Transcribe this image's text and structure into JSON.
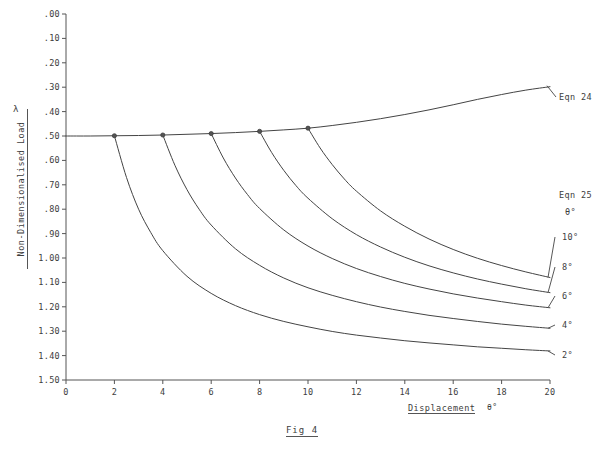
{
  "figure": {
    "caption": "Fig 4",
    "lambda_symbol": "λ"
  },
  "axes": {
    "y_title": "Non-Dimensionalised Load",
    "x_title": "Displacement",
    "x_unit": "θ°",
    "y_ticks": [
      "1.50",
      "1.40",
      "1.30",
      "1.20",
      "1.10",
      "1.00",
      ".90",
      ".80",
      ".70",
      ".60",
      ".50",
      ".40",
      ".30",
      ".20",
      ".10",
      ".00"
    ],
    "x_ticks": [
      "0",
      "2",
      "4",
      "6",
      "8",
      "10",
      "12",
      "14",
      "16",
      "18",
      "20"
    ]
  },
  "annotations": {
    "eqn24_label": "Eqn 24",
    "eqn25_label": "Eqn 25",
    "theta_header": "θ°",
    "branch_labels": [
      "10°",
      "8°",
      "6°",
      "4°",
      "2°"
    ]
  },
  "colors": {
    "line": "#444444",
    "axis": "#555555",
    "text": "#3d3d3d",
    "background": "#ffffff"
  },
  "chart_data": {
    "type": "line",
    "title": "Fig 4",
    "xlabel": "Displacement θ°",
    "ylabel": "Non-Dimensionalised Load λ",
    "xlim": [
      0,
      20
    ],
    "ylim": [
      0.0,
      1.5
    ],
    "x_ticks": [
      0,
      2,
      4,
      6,
      8,
      10,
      12,
      14,
      16,
      18,
      20
    ],
    "y_ticks": [
      0.0,
      0.1,
      0.2,
      0.3,
      0.4,
      0.5,
      0.6,
      0.7,
      0.8,
      0.9,
      1.0,
      1.1,
      1.2,
      1.3,
      1.4,
      1.5
    ],
    "grid": false,
    "legend": "right-side curve labels",
    "series": [
      {
        "name": "Eqn 24",
        "label": "Eqn 24",
        "x": [
          0,
          1,
          2,
          3,
          4,
          5,
          6,
          7,
          8,
          9,
          10,
          11,
          12,
          13,
          14,
          15,
          16,
          17,
          18,
          19,
          20
        ],
        "y": [
          1.0,
          1.0,
          1.001,
          1.002,
          1.004,
          1.007,
          1.01,
          1.014,
          1.019,
          1.025,
          1.032,
          1.043,
          1.056,
          1.071,
          1.088,
          1.107,
          1.128,
          1.15,
          1.17,
          1.188,
          1.202
        ]
      },
      {
        "name": "Eqn 25 theta=2",
        "label": "2°",
        "branch_point": [
          2,
          1.001
        ],
        "x": [
          2,
          2.5,
          3,
          3.5,
          4,
          5,
          6,
          7,
          8,
          9,
          10,
          11,
          12,
          13,
          14,
          15,
          16,
          17,
          18,
          19,
          20
        ],
        "y": [
          1.001,
          0.83,
          0.7,
          0.605,
          0.53,
          0.425,
          0.355,
          0.305,
          0.268,
          0.24,
          0.218,
          0.199,
          0.184,
          0.172,
          0.161,
          0.152,
          0.144,
          0.136,
          0.13,
          0.124,
          0.119
        ]
      },
      {
        "name": "Eqn 25 theta=4",
        "label": "4°",
        "branch_point": [
          4,
          1.004
        ],
        "x": [
          4,
          4.5,
          5,
          5.5,
          6,
          7,
          8,
          9,
          10,
          11,
          12,
          13,
          14,
          15,
          16,
          17,
          18,
          19,
          20
        ],
        "y": [
          1.004,
          0.88,
          0.78,
          0.7,
          0.635,
          0.538,
          0.47,
          0.418,
          0.378,
          0.347,
          0.321,
          0.299,
          0.281,
          0.265,
          0.252,
          0.24,
          0.229,
          0.22,
          0.212
        ]
      },
      {
        "name": "Eqn 25 theta=6",
        "label": "6°",
        "branch_point": [
          6,
          1.01
        ],
        "x": [
          6,
          6.5,
          7,
          7.5,
          8,
          9,
          10,
          11,
          12,
          13,
          14,
          15,
          16,
          17,
          18,
          19,
          20
        ],
        "y": [
          1.01,
          0.91,
          0.828,
          0.76,
          0.703,
          0.615,
          0.549,
          0.498,
          0.457,
          0.424,
          0.396,
          0.373,
          0.353,
          0.336,
          0.321,
          0.307,
          0.296
        ]
      },
      {
        "name": "Eqn 25 theta=8",
        "label": "8°",
        "branch_point": [
          8,
          1.019
        ],
        "x": [
          8,
          8.5,
          9,
          9.5,
          10,
          11,
          12,
          13,
          14,
          15,
          16,
          17,
          18,
          19,
          20
        ],
        "y": [
          1.019,
          0.932,
          0.859,
          0.797,
          0.745,
          0.661,
          0.596,
          0.545,
          0.503,
          0.468,
          0.439,
          0.414,
          0.393,
          0.374,
          0.358
        ]
      },
      {
        "name": "Eqn 25 theta=10",
        "label": "10°",
        "branch_point": [
          10,
          1.032
        ],
        "x": [
          10,
          10.5,
          11,
          11.5,
          12,
          13,
          14,
          15,
          16,
          17,
          18,
          19,
          20
        ],
        "y": [
          1.032,
          0.951,
          0.883,
          0.824,
          0.774,
          0.693,
          0.63,
          0.578,
          0.535,
          0.499,
          0.469,
          0.443,
          0.42
        ]
      }
    ],
    "branch_points": [
      {
        "x": 2,
        "y": 1.001
      },
      {
        "x": 4,
        "y": 1.004
      },
      {
        "x": 6,
        "y": 1.01
      },
      {
        "x": 8,
        "y": 1.019
      },
      {
        "x": 10,
        "y": 1.032
      }
    ]
  }
}
